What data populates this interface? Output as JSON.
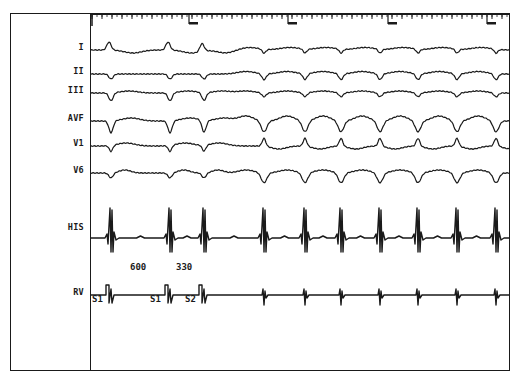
{
  "figure": {
    "type": "intracardiac electrogram recording",
    "leads": [
      {
        "id": "I",
        "label": "I",
        "baseline_y": 50
      },
      {
        "id": "II",
        "label": "II",
        "baseline_y": 74
      },
      {
        "id": "III",
        "label": "III",
        "baseline_y": 93
      },
      {
        "id": "AVF",
        "label": "AVF",
        "baseline_y": 121
      },
      {
        "id": "V1",
        "label": "V1",
        "baseline_y": 146
      },
      {
        "id": "V6",
        "label": "V6",
        "baseline_y": 173
      },
      {
        "id": "HIS",
        "label": "HIS",
        "baseline_y": 238
      },
      {
        "id": "RV",
        "label": "RV",
        "baseline_y": 295
      }
    ],
    "stimulus_labels": [
      {
        "label": "S1",
        "x": 92,
        "y": 297
      },
      {
        "label": "S1",
        "x": 150,
        "y": 297
      },
      {
        "label": "S2",
        "x": 185,
        "y": 297
      }
    ],
    "interval_labels": [
      {
        "label": "600",
        "x": 130,
        "y": 270
      },
      {
        "label": "330",
        "x": 176,
        "y": 270
      }
    ],
    "beat_x_positions": [
      111,
      170,
      204,
      264,
      305,
      341,
      380,
      418,
      457,
      496
    ],
    "paced_beats": 3,
    "ruler": {
      "major_tick_x": [
        189,
        288,
        388,
        487
      ],
      "minor_tick_spacing_px": 10
    },
    "colors": {
      "trace": "#1a1a1a",
      "background": "#ffffff",
      "frame": "#1a1a1a"
    }
  }
}
